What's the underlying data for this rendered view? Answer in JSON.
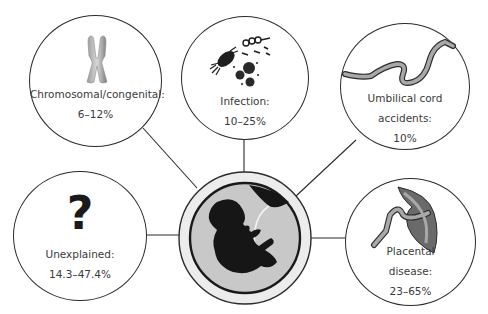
{
  "diagram": {
    "center": {
      "icon": "fetus-in-womb-icon"
    },
    "nodes": [
      {
        "id": "chromosomal",
        "icon": "chromosome-icon",
        "label": "Chromosomal/congenital:",
        "value": "6–12%"
      },
      {
        "id": "infection",
        "icon": "microbes-icon",
        "label": "Infection:",
        "value": "10–25%"
      },
      {
        "id": "umbilical",
        "icon": "umbilical-cord-icon",
        "label_line1": "Umbilical cord",
        "label_line2": "accidents:",
        "value": "10%"
      },
      {
        "id": "unexplained",
        "icon": "question-mark-icon",
        "glyph": "?",
        "label": "Unexplained:",
        "value": "14.3–47.4%"
      },
      {
        "id": "placental",
        "icon": "placenta-icon",
        "label_line1": "Placental",
        "label_line2": "disease:",
        "value": "23–65%"
      }
    ],
    "colors": {
      "stroke": "#2b2b2b",
      "center_ring": "#e6e6e6",
      "center_fill": "#c8c8c8",
      "silhouette": "#161616",
      "placenta": "#6a6a6a",
      "cord": "#a8a8a8"
    }
  }
}
